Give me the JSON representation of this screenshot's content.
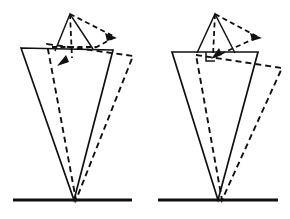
{
  "figure": {
    "title": "",
    "caption": "",
    "background_color": "#ffffff",
    "ink_color": "#111111",
    "width": 290,
    "height": 219,
    "panel_count": 2,
    "panels": [
      {
        "id": "left-panel",
        "label": "",
        "origin_x": 0,
        "origin_y": 0,
        "pivot": {
          "x": 74,
          "y": 200
        },
        "baseline": {
          "x1": 13,
          "y1": 200,
          "x2": 132,
          "y2": 200
        },
        "solid_wedge": {
          "name": "solid-wedge",
          "points": "21,48 113,50 74,200",
          "top_left": {
            "x": 21,
            "y": 48
          },
          "top_right": {
            "x": 113,
            "y": 50
          },
          "apex": {
            "x": 74,
            "y": 200
          }
        },
        "dashed_wedge": {
          "name": "dashed-wedge",
          "points": "47,44 133,56 76,200",
          "top_left": {
            "x": 47,
            "y": 44
          },
          "top_right": {
            "x": 133,
            "y": 56
          },
          "apex": {
            "x": 76,
            "y": 200
          }
        },
        "solid_cap": {
          "name": "solid-cap-triangle",
          "points": "70,14 55,51 93,49",
          "peak": {
            "x": 70,
            "y": 14
          },
          "left_foot": {
            "x": 55,
            "y": 51
          },
          "right_foot": {
            "x": 93,
            "y": 49
          }
        },
        "dashed_cap": {
          "name": "dashed-cap-triangle",
          "points": "70,14 115,37 93,49",
          "peak": {
            "x": 70,
            "y": 14
          },
          "right_foot": {
            "x": 115,
            "y": 37
          },
          "base_foot": {
            "x": 93,
            "y": 49
          }
        },
        "dashed_axis": {
          "name": "dashed-center-axis",
          "x1": 70,
          "y1": 14,
          "x2": 72,
          "y2": 58
        },
        "dashed_crossbar": {
          "name": "dashed-horizontal-tick",
          "x1": 52,
          "y1": 47,
          "x2": 97,
          "y2": 47
        },
        "arrows": [
          {
            "name": "rotation-arrow-upper-right",
            "tip": {
              "x": 116,
              "y": 38
            },
            "angle_deg": 28,
            "size": 7
          },
          {
            "name": "rotation-arrow-lower-left",
            "tip": {
              "x": 58,
              "y": 65
            },
            "angle_deg": 208,
            "size": 7
          }
        ]
      },
      {
        "id": "right-panel",
        "label": "",
        "origin_x": 145,
        "origin_y": 0,
        "pivot": {
          "x": 218,
          "y": 200
        },
        "baseline": {
          "x1": 158,
          "y1": 200,
          "x2": 278,
          "y2": 200
        },
        "solid_wedge": {
          "name": "solid-wedge",
          "points": "172,52 258,52 218,200",
          "top_left": {
            "x": 172,
            "y": 52
          },
          "top_right": {
            "x": 258,
            "y": 52
          },
          "apex": {
            "x": 218,
            "y": 200
          }
        },
        "dashed_wedge": {
          "name": "dashed-wedge",
          "points": "196,55 282,68 222,200",
          "top_left": {
            "x": 196,
            "y": 55
          },
          "top_right": {
            "x": 282,
            "y": 68
          },
          "apex": {
            "x": 222,
            "y": 200
          }
        },
        "solid_cap": {
          "name": "solid-cap-triangle",
          "points": "215,14 197,53 235,53",
          "peak": {
            "x": 215,
            "y": 14
          },
          "left_foot": {
            "x": 197,
            "y": 53
          },
          "right_foot": {
            "x": 235,
            "y": 53
          }
        },
        "dashed_cap": {
          "name": "dashed-cap-triangle",
          "points": "215,14 258,37 214,56",
          "peak": {
            "x": 215,
            "y": 14
          },
          "right_foot": {
            "x": 258,
            "y": 37
          },
          "base_foot": {
            "x": 214,
            "y": 56
          }
        },
        "dashed_axis": {
          "name": "dashed-center-axis",
          "x1": 215,
          "y1": 14,
          "x2": 213,
          "y2": 56
        },
        "right_angle_marker": {
          "name": "right-angle-marker",
          "points": "206,52 206,60 214,60",
          "corner": {
            "x": 206,
            "y": 60
          }
        },
        "arrows": [
          {
            "name": "rotation-arrow-upper-right",
            "tip": {
              "x": 261,
              "y": 38
            },
            "angle_deg": 28,
            "size": 7
          },
          {
            "name": "rotation-arrow-lower-left",
            "tip": {
              "x": 212,
              "y": 58
            },
            "angle_deg": 205,
            "size": 7
          }
        ]
      }
    ]
  }
}
